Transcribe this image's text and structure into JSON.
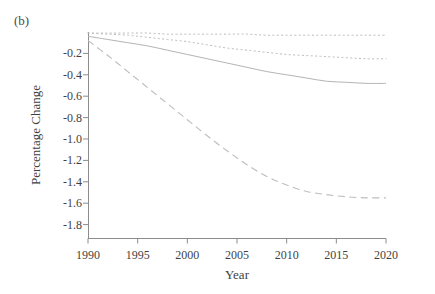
{
  "panel": {
    "label": "(b)"
  },
  "axes": {
    "xlabel": "Year",
    "ylabel": "Percentage Change",
    "x_ticks": [
      "1990",
      "1995",
      "2000",
      "2005",
      "2010",
      "2015",
      "2020"
    ],
    "y_ticks": [
      "-0.2",
      "-0.4",
      "-0.6",
      "-0.8",
      "-1.0",
      "-1.2",
      "-1.4",
      "-1.6",
      "-1.8"
    ]
  },
  "chart_data": {
    "type": "line",
    "title": "(b)",
    "xlabel": "Year",
    "ylabel": "Percentage Change",
    "xlim": [
      1990,
      2020
    ],
    "ylim": [
      -1.93,
      0.0
    ],
    "grid": false,
    "legend": "none",
    "x": [
      1990,
      1992,
      1994,
      1996,
      1998,
      2000,
      2002,
      2004,
      2006,
      2008,
      2010,
      2012,
      2014,
      2016,
      2018,
      2020
    ],
    "series": [
      {
        "name": "series-1",
        "style": "dotted",
        "color": "#b9b9b9",
        "values": [
          -0.01,
          -0.01,
          -0.01,
          -0.01,
          -0.02,
          -0.02,
          -0.02,
          -0.02,
          -0.02,
          -0.03,
          -0.03,
          -0.03,
          -0.03,
          -0.03,
          -0.03,
          -0.03
        ]
      },
      {
        "name": "series-2",
        "style": "dotted",
        "color": "#b9b9b9",
        "values": [
          -0.01,
          -0.02,
          -0.03,
          -0.05,
          -0.07,
          -0.09,
          -0.12,
          -0.15,
          -0.17,
          -0.19,
          -0.21,
          -0.22,
          -0.23,
          -0.24,
          -0.25,
          -0.25
        ]
      },
      {
        "name": "series-3",
        "style": "solid",
        "color": "#b4b4b4",
        "values": [
          -0.04,
          -0.07,
          -0.1,
          -0.13,
          -0.17,
          -0.21,
          -0.25,
          -0.29,
          -0.33,
          -0.37,
          -0.4,
          -0.43,
          -0.46,
          -0.47,
          -0.48,
          -0.48
        ]
      },
      {
        "name": "series-4",
        "style": "dashed",
        "color": "#bdbdbd",
        "values": [
          -0.08,
          -0.22,
          -0.37,
          -0.52,
          -0.67,
          -0.82,
          -0.97,
          -1.11,
          -1.24,
          -1.35,
          -1.43,
          -1.49,
          -1.52,
          -1.54,
          -1.55,
          -1.55
        ]
      }
    ]
  }
}
